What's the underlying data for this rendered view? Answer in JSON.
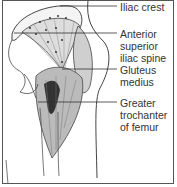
{
  "figure": {
    "labels": [
      {
        "id": "iliac_crest",
        "text": "Iliac crest"
      },
      {
        "id": "asis",
        "text": "Anterior\nsuperior\niliac spine"
      },
      {
        "id": "gluteus_medius",
        "text": "Gluteus\nmedius"
      },
      {
        "id": "greater_trochanter",
        "text": "Greater\ntrochanter\nof femur"
      }
    ]
  }
}
